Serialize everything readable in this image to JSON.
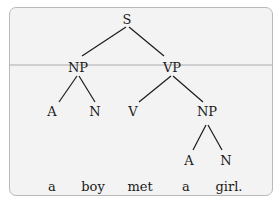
{
  "tree": {
    "nodes": {
      "S": {
        "label": "S"
      },
      "NP1": {
        "label": "NP"
      },
      "VP": {
        "label": "VP"
      },
      "A1": {
        "label": "A"
      },
      "N1": {
        "label": "N"
      },
      "V": {
        "label": "V"
      },
      "NP2": {
        "label": "NP"
      },
      "A2": {
        "label": "A"
      },
      "N2": {
        "label": "N"
      }
    },
    "words": [
      "a",
      "boy",
      "met",
      "a",
      "girl."
    ],
    "edges": [
      [
        "S",
        "NP1"
      ],
      [
        "S",
        "VP"
      ],
      [
        "NP1",
        "A1"
      ],
      [
        "NP1",
        "N1"
      ],
      [
        "VP",
        "V"
      ],
      [
        "VP",
        "NP2"
      ],
      [
        "NP2",
        "A2"
      ],
      [
        "NP2",
        "N2"
      ]
    ]
  }
}
